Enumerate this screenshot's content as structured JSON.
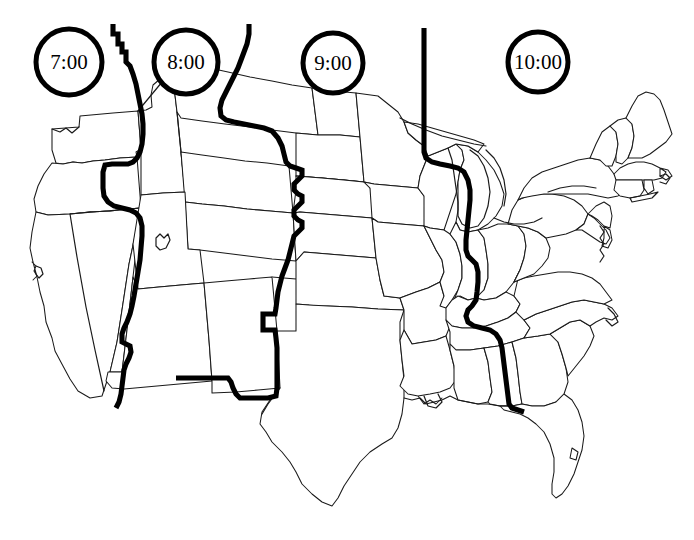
{
  "figure": {
    "kind": "us-time-zone-map",
    "background_color": "#ffffff",
    "outline_color": "#1a1a1a",
    "boundary_color": "#000000"
  },
  "clocks": [
    {
      "id": "clock-pacific",
      "label": "7:00",
      "zone": "Pacific",
      "cx": 69,
      "cy": 62,
      "r": 33
    },
    {
      "id": "clock-mountain",
      "label": "8:00",
      "zone": "Mountain",
      "cx": 186,
      "cy": 62,
      "r": 32
    },
    {
      "id": "clock-central",
      "label": "9:00",
      "zone": "Central",
      "cx": 333,
      "cy": 63,
      "r": 30
    },
    {
      "id": "clock-eastern",
      "label": "10:00",
      "zone": "Eastern",
      "cx": 538,
      "cy": 62,
      "r": 30
    }
  ],
  "time_zone_boundaries": [
    {
      "id": "boundary-pacific-mountain",
      "between": "Pacific / Mountain"
    },
    {
      "id": "boundary-mountain-central",
      "between": "Mountain / Central"
    },
    {
      "id": "boundary-central-eastern",
      "between": "Central / Eastern"
    }
  ]
}
